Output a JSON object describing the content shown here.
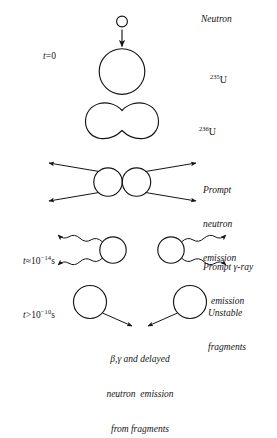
{
  "figure": {
    "name": "nuclear-fission-sequence-diagram",
    "background_color": "#ffffff",
    "stroke_color": "#141414",
    "stages": [
      {
        "id": "capture",
        "time_label": "t = 0",
        "labels": [
          "Neutron",
          "235U"
        ]
      },
      {
        "id": "compound-nucleus",
        "labels": [
          "236U"
        ]
      },
      {
        "id": "prompt-neutron",
        "labels": [
          "Prompt neutron emission"
        ]
      },
      {
        "id": "prompt-gamma",
        "time_label": "t ~ 10^-14 s",
        "labels": [
          "Prompt gamma-ray emission"
        ]
      },
      {
        "id": "delayed-decay",
        "time_label": "t > 10^-10 s",
        "labels": [
          "Unstable fragments",
          "beta, gamma and delayed neutron emission from fragments"
        ]
      }
    ]
  },
  "time_labels": {
    "t_zero": {
      "var": "t",
      "eq": "=",
      "value": "0"
    },
    "t_prompt_gamma": {
      "var": "t",
      "rel": "≈",
      "base": "10",
      "exp": "−14",
      "unit": "s"
    },
    "t_delayed": {
      "var": "t",
      "rel": ">",
      "base": "10",
      "exp": "−10",
      "unit": "s"
    }
  },
  "isotopes": {
    "u235": {
      "mass_number": "235",
      "symbol": "U"
    },
    "u236": {
      "mass_number": "236",
      "symbol": "U"
    }
  },
  "annotations": {
    "neutron": "Neutron",
    "prompt_neutron": [
      "Prompt",
      "neutron",
      "emission"
    ],
    "prompt_gamma": [
      "Prompt γ-ray",
      "emission"
    ],
    "unstable_fragments": [
      "Unstable",
      "fragments"
    ],
    "delayed_emission": [
      "β,γ and delayed",
      "neutron  emission",
      "from fragments"
    ]
  }
}
